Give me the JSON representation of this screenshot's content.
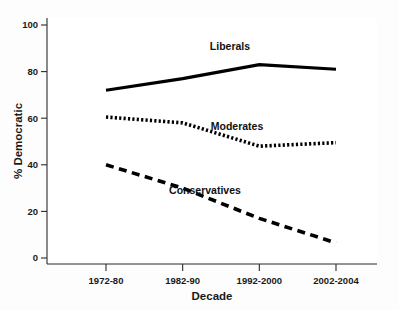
{
  "chart_data": {
    "type": "line",
    "title": "",
    "xlabel": "Decade",
    "ylabel": "% Democratic",
    "categories": [
      "1972-80",
      "1982-90",
      "1992-2000",
      "2002-2004"
    ],
    "ylim": [
      0,
      100
    ],
    "yticks": [
      0,
      20,
      40,
      60,
      80,
      100
    ],
    "ytick_labels": [
      "0",
      "20",
      "40",
      "60",
      "80",
      "100"
    ],
    "grid": false,
    "legend_position": "inline-annotations",
    "series": [
      {
        "name": "Liberals",
        "style": "solid",
        "color": "#000000",
        "values": [
          72,
          77,
          83,
          81
        ]
      },
      {
        "name": "Moderates",
        "style": "dotted",
        "color": "#000000",
        "values": [
          60.5,
          58,
          48,
          49.5
        ]
      },
      {
        "name": "Conservatives",
        "style": "dashed",
        "color": "#000000",
        "values": [
          40,
          30,
          17,
          6.5
        ]
      }
    ],
    "annotations": [
      {
        "text": "Liberals",
        "x_px": 230,
        "y_px": 50
      },
      {
        "text": "Moderates",
        "x_px": 237,
        "y_px": 130
      },
      {
        "text": "Conservatives",
        "x_px": 205,
        "y_px": 194
      }
    ]
  }
}
